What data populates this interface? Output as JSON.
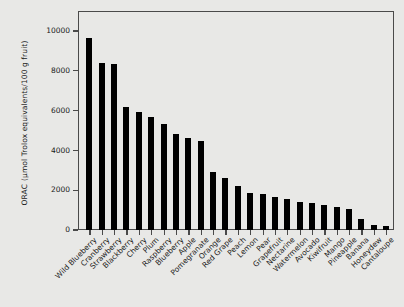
{
  "chart_data": {
    "type": "bar",
    "title": "",
    "subtitle": "",
    "xlabel": "",
    "ylabel_line1": "ORAC",
    "ylabel_line2": "(µmol Trolox equivalents/100 g fruit)",
    "ylim": [
      0,
      11000
    ],
    "yticks": [
      0,
      2000,
      4000,
      6000,
      8000,
      10000
    ],
    "ytick_labels": [
      "0",
      "2000",
      "4000",
      "6000",
      "8000",
      "10000"
    ],
    "grid": false,
    "legend": null,
    "orientation": "vertical",
    "bar_color": "#000000",
    "categories": [
      "Wild Blueberry",
      "Cranberry",
      "Strawberry",
      "Blackberry",
      "Cherry",
      "Plum",
      "Raspberry",
      "Blueberry",
      "Apple",
      "Pomegranate",
      "Orange",
      "Red Grape",
      "Peach",
      "Lemon",
      "Pear",
      "Grapefruit",
      "Nectarine",
      "Watermelon",
      "Avocado",
      "Kiwifruit",
      "Mango",
      "Pineapple",
      "Banana",
      "Honeydew",
      "Cantaloupe"
    ],
    "values": [
      9620,
      8400,
      8350,
      6200,
      5950,
      5700,
      5300,
      4800,
      4600,
      4450,
      2900,
      2600,
      2220,
      1880,
      1790,
      1640,
      1550,
      1400,
      1340,
      1250,
      1150,
      1040,
      550,
      250,
      200
    ]
  },
  "figure": {
    "background_color": "#e8e8e6",
    "frame_color": "#4a4a4a",
    "text_color": "#1a1a1a"
  }
}
